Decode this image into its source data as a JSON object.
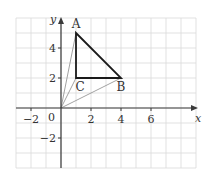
{
  "figure": {
    "axes": {
      "x_label": "x",
      "y_label": "y",
      "origin_label": "0",
      "x_ticks": [
        {
          "value": -2,
          "label": "−2"
        },
        {
          "value": 2,
          "label": "2"
        },
        {
          "value": 4,
          "label": "4"
        },
        {
          "value": 6,
          "label": "6"
        }
      ],
      "y_ticks": [
        {
          "value": 4,
          "label": "4"
        },
        {
          "value": 2,
          "label": "2"
        },
        {
          "value": -2,
          "label": "−2"
        }
      ],
      "x_range": [
        -3,
        9
      ],
      "y_range": [
        -4,
        6
      ],
      "grid": true
    },
    "points": {
      "A": {
        "label": "A",
        "x": 1,
        "y": 5
      },
      "B": {
        "label": "B",
        "x": 4,
        "y": 2
      },
      "C": {
        "label": "C",
        "x": 1,
        "y": 2
      }
    },
    "triangle": [
      "A",
      "B",
      "C"
    ],
    "rays_from_origin": [
      "A",
      "C",
      "B"
    ],
    "colors": {
      "grid": "#d9d9d9",
      "axis": "#3a3a3a",
      "triangle": "#1a1a1a",
      "ray": "#8a8a8a",
      "text": "#333333"
    }
  }
}
